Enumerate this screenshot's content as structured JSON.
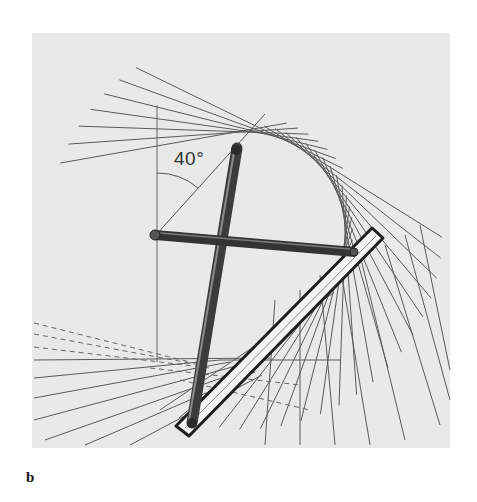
{
  "figure": {
    "panel_label": "b",
    "angle_label": "40°",
    "background_color": "#e9e9e9",
    "line_color": "#555555",
    "rod_color": "#3a3a3a"
  },
  "elements": {
    "reference_line": "vertical reference line",
    "angle_arc": "40 degree angle arc",
    "horizontal_rod": "horizontal linkage rod",
    "vertical_rod": "vertical linkage rod",
    "slotted_bar": "slotted guide bar",
    "envelope_lines": "family of tangent lines forming envelope curve"
  }
}
